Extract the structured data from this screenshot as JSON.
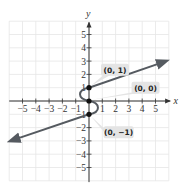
{
  "chart_data": {
    "type": "line",
    "title": "",
    "xlabel": "x",
    "ylabel": "y",
    "xlim": [
      -6,
      6
    ],
    "ylim": [
      -6,
      6
    ],
    "grid": true,
    "x_ticks": [
      "-5",
      "-4",
      "-3",
      "-2",
      "-1",
      "1",
      "2",
      "3",
      "4",
      "5"
    ],
    "y_ticks": [
      "5",
      "4",
      "3",
      "2",
      "1",
      "-1",
      "-2",
      "-3",
      "-4",
      "-5"
    ],
    "series": [
      {
        "name": "upper ray",
        "points": [
          [
            0,
            1
          ],
          [
            5.8,
            3
          ]
        ],
        "arrow": "end"
      },
      {
        "name": "S-curve",
        "points": [
          [
            0,
            1
          ],
          [
            -0.5,
            0.5
          ],
          [
            0,
            0
          ],
          [
            0.5,
            -0.5
          ],
          [
            0,
            -1
          ]
        ]
      },
      {
        "name": "lower ray",
        "points": [
          [
            0,
            -1
          ],
          [
            -5.9,
            -3
          ]
        ],
        "arrow": "end"
      }
    ],
    "highlighted_points": [
      {
        "label": "(0, 1)",
        "x": 0,
        "y": 1
      },
      {
        "label": "(0, 0)",
        "x": 0,
        "y": 0
      },
      {
        "label": "(0, −1)",
        "x": 0,
        "y": -1
      }
    ],
    "colors": {
      "curve": "#555a60",
      "grid": "#e6e6e6",
      "axis": "#333333",
      "label_bg": "#e4e4e4"
    }
  }
}
